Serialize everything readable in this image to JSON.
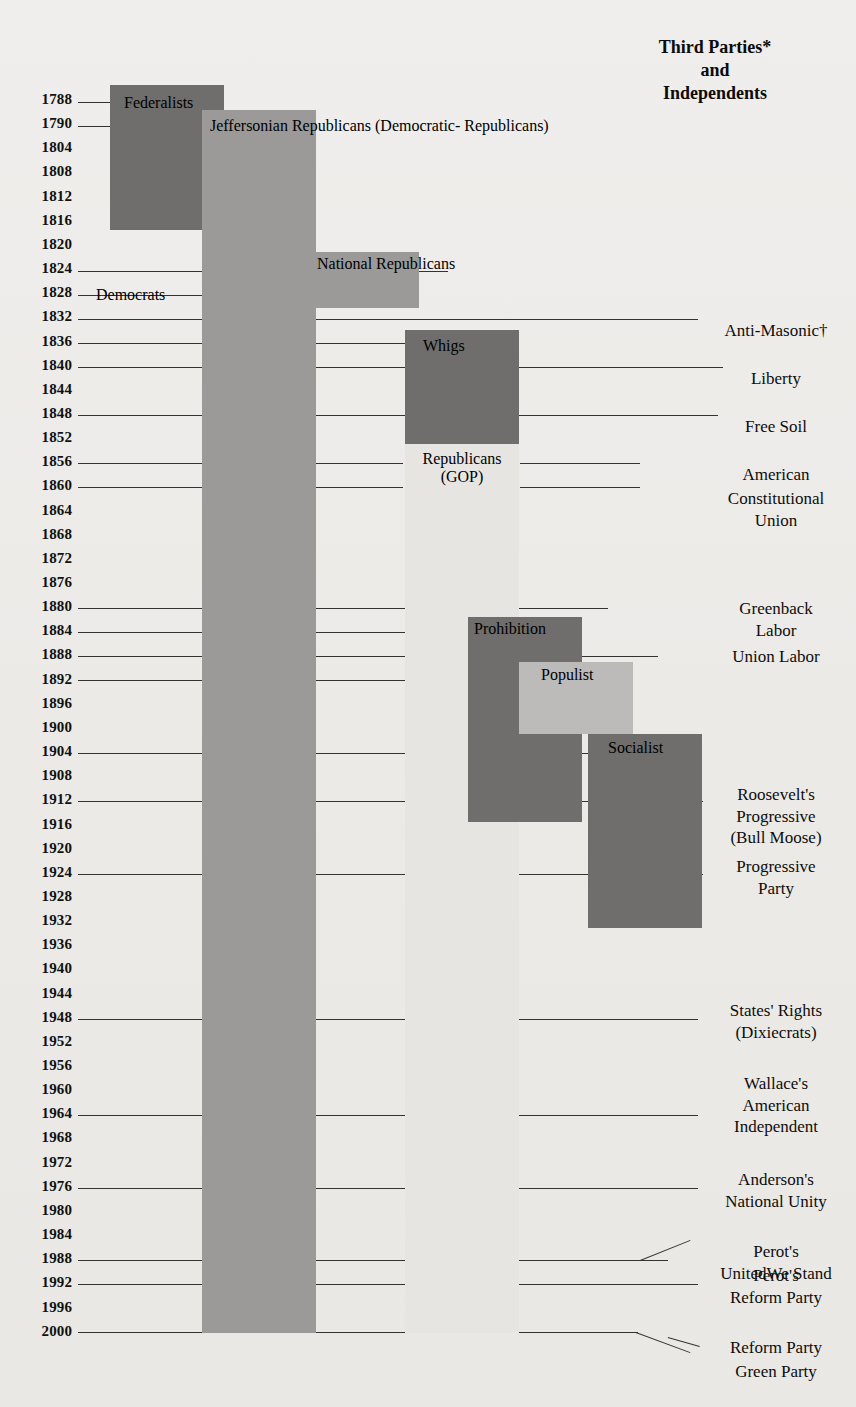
{
  "header": {
    "third_parties_title_line1": "Third Parties*",
    "third_parties_title_line2": "and",
    "third_parties_title_line3": "Independents"
  },
  "axis": {
    "label": "Election Years",
    "years": [
      "1788",
      "1790",
      "1804",
      "1808",
      "1812",
      "1816",
      "1820",
      "1824",
      "1828",
      "1832",
      "1836",
      "1840",
      "1844",
      "1848",
      "1852",
      "1856",
      "1860",
      "1864",
      "1868",
      "1872",
      "1876",
      "1880",
      "1884",
      "1888",
      "1892",
      "1896",
      "1900",
      "1904",
      "1908",
      "1912",
      "1916",
      "1920",
      "1924",
      "1928",
      "1932",
      "1936",
      "1940",
      "1944",
      "1948",
      "1952",
      "1956",
      "1960",
      "1964",
      "1968",
      "1972",
      "1976",
      "1980",
      "1984",
      "1988",
      "1992",
      "1996",
      "2000"
    ],
    "first_year_y": 102,
    "row_spacing": 24.15
  },
  "colors": {
    "background": "#eeedeb",
    "dark": "#6f6e6c",
    "mid": "#9b9a98",
    "light": "#bcbbb9",
    "very_light": "#cfcecb",
    "rule": "#35332f",
    "text": "#0d0d0d"
  },
  "chart_data": {
    "type": "timeline",
    "xlabel": "",
    "ylabel": "Election Years",
    "year_range": [
      1788,
      2000
    ],
    "major_parties": [
      {
        "name": "Federalists",
        "label": "Federalists",
        "start_year": 1788,
        "end_year": 1816,
        "color": "#6f6e6c",
        "x": 110,
        "y": 85,
        "w": 114,
        "h": 145,
        "label_x": 14,
        "label_y": 9
      },
      {
        "name": "Jeffersonian Republicans",
        "label": "Jeffersonian\nRepublicans\n(Democratic-\nRepublicans)",
        "start_year": 1790,
        "end_year": 1828,
        "color": "#9b9a98",
        "x": 202,
        "y": 110,
        "w": 114,
        "h": 170,
        "label_x": 8,
        "label_y": 7
      },
      {
        "name": "Democrats",
        "label": "Democrats",
        "start_year": 1828,
        "end_year": 2000,
        "color": "#9b9a98",
        "x": 202,
        "y": 280,
        "w": 114,
        "h": 1053,
        "label_x": -106,
        "label_y": 6
      },
      {
        "name": "National Republicans",
        "label": "National\nRepublicans",
        "start_year": 1824,
        "end_year": 1832,
        "color": "#9b9a98",
        "x": 305,
        "y": 252,
        "w": 114,
        "h": 56,
        "label_x": 12,
        "label_y": 3
      },
      {
        "name": "Whigs",
        "label": "Whigs",
        "start_year": 1836,
        "end_year": 1852,
        "color": "#6f6e6c",
        "x": 405,
        "y": 330,
        "w": 114,
        "h": 114,
        "label_x": 18,
        "label_y": 7
      },
      {
        "name": "Republicans (GOP)",
        "label": "Republicans\n(GOP)",
        "start_year": 1856,
        "end_year": 2000,
        "color": "#e6e5e2",
        "x": 405,
        "y": 444,
        "w": 114,
        "h": 889,
        "label_x": 0,
        "label_y": 6
      }
    ],
    "minor_parties": [
      {
        "name": "Prohibition",
        "label": "Prohibition",
        "start_year": 1884,
        "end_year": 1916,
        "color": "#6f6e6c",
        "x": 468,
        "y": 617,
        "w": 114,
        "h": 205,
        "label_x": 6,
        "label_y": 3
      },
      {
        "name": "Populist",
        "label": "Populist",
        "start_year": 1892,
        "end_year": 1900,
        "color": "#bcbbb9",
        "x": 519,
        "y": 662,
        "w": 114,
        "h": 72,
        "label_x": 22,
        "label_y": 4
      },
      {
        "name": "Socialist",
        "label": "Socialist",
        "start_year": 1904,
        "end_year": 1932,
        "color": "#6f6e6c",
        "x": 588,
        "y": 734,
        "w": 114,
        "h": 194,
        "label_x": 20,
        "label_y": 5
      }
    ],
    "third_parties": [
      {
        "name": "Anti-Masonic",
        "label": "Anti-Masonic†",
        "year": 1832,
        "y": 320,
        "lines": 1,
        "leader_x1": 330,
        "leader_x2": 700
      },
      {
        "name": "Liberty",
        "label": "Liberty",
        "year": 1840,
        "y": 368,
        "lines": 1,
        "leader_x1": 530,
        "leader_x2": 728
      },
      {
        "name": "Free Soil",
        "label": "Free Soil",
        "year": 1848,
        "y": 416,
        "lines": 1,
        "leader_x1": 530,
        "leader_x2": 722
      },
      {
        "name": "American",
        "label": "American",
        "year": 1856,
        "y": 464,
        "lines": 1,
        "leader_x1": 530,
        "leader_x2": 722
      },
      {
        "name": "Constitutional Union",
        "label": "Constitutional\nUnion",
        "year": 1860,
        "y": 488,
        "lines": 2,
        "leader_x1": 530,
        "leader_x2": 700
      },
      {
        "name": "Greenback Labor",
        "label": "Greenback\nLabor",
        "year": 1880,
        "y": 598,
        "lines": 2,
        "leader_x1": 530,
        "leader_x2": 712
      },
      {
        "name": "Union Labor",
        "label": "Union Labor",
        "year": 1888,
        "y": 646,
        "lines": 1,
        "leader_x1": 585,
        "leader_x2": 712
      },
      {
        "name": "Roosevelt's Progressive (Bull Moose)",
        "label": "Roosevelt's\nProgressive\n(Bull Moose)",
        "year": 1912,
        "y": 784,
        "lines": 3,
        "leader_x1": 702,
        "leader_x2": 712
      },
      {
        "name": "Progressive Party",
        "label": "Progressive\nParty",
        "year": 1924,
        "y": 856,
        "lines": 2,
        "leader_x1": 702,
        "leader_x2": 712
      },
      {
        "name": "States' Rights (Dixiecrats)",
        "label": "States' Rights\n(Dixiecrats)",
        "year": 1948,
        "y": 1000,
        "lines": 2,
        "leader_x1": 330,
        "leader_x2": 700
      },
      {
        "name": "Wallace's American Independent",
        "label": "Wallace's\nAmerican\nIndependent",
        "year": 1968,
        "y": 1073,
        "lines": 3,
        "leader_x1": 330,
        "leader_x2": 700
      },
      {
        "name": "Anderson's National Unity",
        "label": "Anderson's\nNational Unity",
        "year": 1980,
        "y": 1169,
        "lines": 2,
        "leader_x1": 330,
        "leader_x2": 700
      },
      {
        "name": "Perot's United We Stand",
        "label": "Perot's\nUnitedWe Stand",
        "year": 1992,
        "y": 1241,
        "lines": 2,
        "leader_x1": 330,
        "leader_x2": 680
      },
      {
        "name": "Perot's Reform Party",
        "label": "Perot's\nReform Party",
        "year": 1996,
        "y": 1265,
        "lines": 2,
        "leader_x1": 330,
        "leader_x2": 700
      },
      {
        "name": "Reform Party",
        "label": "Reform Party",
        "year": 2000,
        "y": 1337,
        "lines": 1,
        "leader_x1": 330,
        "leader_x2": 690
      },
      {
        "name": "Green Party",
        "label": "Green Party",
        "year": 2000,
        "y": 1361,
        "lines": 1,
        "leader_x1": 330,
        "leader_x2": 690
      }
    ],
    "footnotes": [
      "* Third Parties",
      "† Anti-Masonic"
    ]
  },
  "year_leaders": [
    {
      "year": "1788",
      "x": 78,
      "w": 34,
      "y": 102
    },
    {
      "year": "1790",
      "x": 78,
      "w": 125,
      "y": 126
    },
    {
      "year": "1824",
      "x": 78,
      "w": 370,
      "y": 271
    },
    {
      "year": "1828",
      "x": 78,
      "w": 130,
      "y": 295
    },
    {
      "year": "1832",
      "x": 78,
      "w": 620,
      "y": 319
    },
    {
      "year": "1836",
      "x": 78,
      "w": 352,
      "y": 343
    },
    {
      "year": "1840",
      "x": 78,
      "w": 645,
      "y": 367
    },
    {
      "year": "1848",
      "x": 78,
      "w": 640,
      "y": 415
    },
    {
      "year": "1856",
      "x": 78,
      "w": 325,
      "y": 463
    },
    {
      "year": "1856b",
      "x": 520,
      "w": 120,
      "y": 463
    },
    {
      "year": "1860",
      "x": 78,
      "w": 325,
      "y": 487
    },
    {
      "year": "1860b",
      "x": 520,
      "w": 120,
      "y": 487
    },
    {
      "year": "1880",
      "x": 78,
      "w": 530,
      "y": 608
    },
    {
      "year": "1884",
      "x": 78,
      "w": 392,
      "y": 632
    },
    {
      "year": "1888",
      "x": 78,
      "w": 580,
      "y": 656
    },
    {
      "year": "1892",
      "x": 78,
      "w": 444,
      "y": 680
    },
    {
      "year": "1904",
      "x": 78,
      "w": 515,
      "y": 753
    },
    {
      "year": "1912",
      "x": 78,
      "w": 625,
      "y": 801
    },
    {
      "year": "1924",
      "x": 78,
      "w": 625,
      "y": 874
    },
    {
      "year": "1948",
      "x": 78,
      "w": 620,
      "y": 1019
    },
    {
      "year": "1968",
      "x": 78,
      "w": 620,
      "y": 1115
    },
    {
      "year": "1980",
      "x": 78,
      "w": 620,
      "y": 1188
    },
    {
      "year": "1992",
      "x": 78,
      "w": 590,
      "y": 1260
    },
    {
      "year": "1996",
      "x": 78,
      "w": 620,
      "y": 1284
    },
    {
      "year": "2000",
      "x": 78,
      "w": 560,
      "y": 1332
    }
  ]
}
